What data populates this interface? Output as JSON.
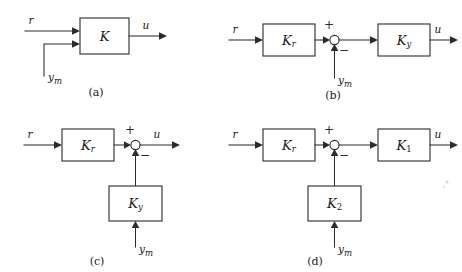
{
  "figure": {
    "background_color": "#ffffff",
    "line_color": "#2b2b2b",
    "panel_count": 4
  },
  "panels": [
    {
      "id": "a",
      "caption": "(a)",
      "description": "Single controller K with two inputs r and y_m",
      "blocks": [
        {
          "label": "K",
          "sub": ""
        }
      ],
      "signals": {
        "reference": "r",
        "measurement": "y",
        "measurement_sub": "m",
        "output": "u"
      },
      "has_summing_junction": false,
      "summing_signs": []
    },
    {
      "id": "b",
      "caption": "(b)",
      "description": "Kr feeds summing junction, y_m subtracted, result into Ky giving u",
      "blocks": [
        {
          "label": "K",
          "sub": "r"
        },
        {
          "label": "K",
          "sub": "y"
        }
      ],
      "signals": {
        "reference": "r",
        "measurement": "y",
        "measurement_sub": "m",
        "output": "u"
      },
      "has_summing_junction": true,
      "summing_signs": [
        "+",
        "−"
      ]
    },
    {
      "id": "c",
      "caption": "(c)",
      "description": "Kr feeds summing junction directly to u, with Ky in feedback path from y_m",
      "blocks": [
        {
          "label": "K",
          "sub": "r"
        },
        {
          "label": "K",
          "sub": "y"
        }
      ],
      "signals": {
        "reference": "r",
        "measurement": "y",
        "measurement_sub": "m",
        "output": "u"
      },
      "has_summing_junction": true,
      "summing_signs": [
        "+",
        "−"
      ]
    },
    {
      "id": "d",
      "caption": "(d)",
      "description": "Kr feeds summing junction into K1 giving u, with K2 in feedback path from y_m",
      "blocks": [
        {
          "label": "K",
          "sub": "r"
        },
        {
          "label": "K",
          "sub": "1"
        },
        {
          "label": "K",
          "sub": "2"
        }
      ],
      "signals": {
        "reference": "r",
        "measurement": "y",
        "measurement_sub": "m",
        "output": "u"
      },
      "has_summing_junction": true,
      "summing_signs": [
        "+",
        "−"
      ]
    }
  ]
}
